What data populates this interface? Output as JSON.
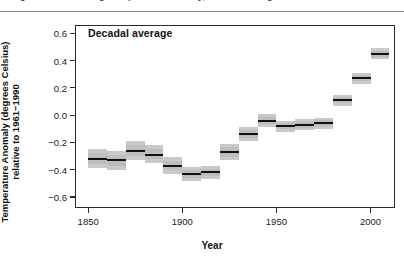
{
  "figure": {
    "cut_off_caption": "Figure: Global average temperature anomaly, decadal averages",
    "legend_label": "Decadal average"
  },
  "chart_data": {
    "type": "bar",
    "title": "",
    "subtitle": "",
    "annotation": "Decadal average",
    "xlabel": "Year",
    "ylabel": "Temperature Anomaly (degrees Celsius) relative to 1961−1990",
    "ylabel_line1": "Temperature Anomaly (degrees Celsius)",
    "ylabel_line2": "relative to 1961−1990",
    "xlim": [
      1843,
      2013
    ],
    "ylim": [
      -0.68,
      0.66
    ],
    "xticks": [
      1850,
      1900,
      1950,
      2000
    ],
    "xtick_labels": [
      "1850",
      "1900",
      "1950",
      "2000"
    ],
    "yticks": [
      -0.6,
      -0.4,
      -0.2,
      0.0,
      0.2,
      0.4,
      0.6
    ],
    "ytick_labels": [
      "−0.6",
      "−0.4",
      "−0.2",
      "0.0",
      "0.2",
      "0.4",
      "0.6"
    ],
    "grid": false,
    "legend_position": "top-left",
    "mean_color": "#111111",
    "band_color": "#c9c9c9",
    "decade_width_years": 10,
    "categories": [
      "1850s",
      "1860s",
      "1870s",
      "1880s",
      "1890s",
      "1900s",
      "1910s",
      "1920s",
      "1930s",
      "1940s",
      "1950s",
      "1960s",
      "1970s",
      "1980s",
      "1990s",
      "2000s"
    ],
    "x": [
      1855,
      1865,
      1875,
      1885,
      1895,
      1905,
      1915,
      1925,
      1935,
      1945,
      1955,
      1965,
      1975,
      1985,
      1995,
      2005
    ],
    "values": [
      -0.32,
      -0.33,
      -0.26,
      -0.29,
      -0.37,
      -0.43,
      -0.42,
      -0.27,
      -0.14,
      -0.04,
      -0.08,
      -0.07,
      -0.06,
      0.11,
      0.27,
      0.45
    ],
    "ci_low": [
      -0.39,
      -0.4,
      -0.33,
      -0.35,
      -0.43,
      -0.48,
      -0.47,
      -0.33,
      -0.19,
      -0.09,
      -0.12,
      -0.11,
      -0.1,
      0.07,
      0.23,
      0.41
    ],
    "ci_high": [
      -0.25,
      -0.26,
      -0.19,
      -0.22,
      -0.31,
      -0.38,
      -0.37,
      -0.21,
      -0.09,
      0.01,
      -0.04,
      -0.03,
      -0.02,
      0.15,
      0.31,
      0.49
    ],
    "series": [
      {
        "name": "Decadal average",
        "values": [
          -0.32,
          -0.33,
          -0.26,
          -0.29,
          -0.37,
          -0.43,
          -0.42,
          -0.27,
          -0.14,
          -0.04,
          -0.08,
          -0.07,
          -0.06,
          0.11,
          0.27,
          0.45
        ]
      }
    ]
  }
}
